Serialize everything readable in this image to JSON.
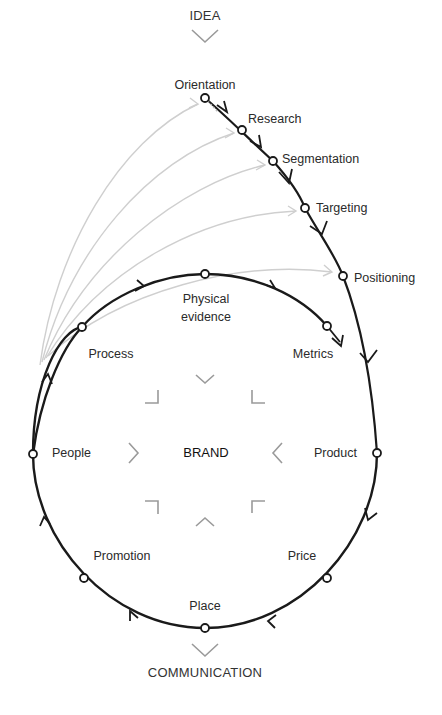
{
  "diagram": {
    "type": "brand-process-flow",
    "top_label": "IDEA",
    "bottom_label": "COMMUNICATION",
    "center_label": "BRAND",
    "colors": {
      "main_line": "#1a1a1a",
      "feedback_arcs": "#c8c8c8",
      "chevrons": "#9a9a9a",
      "node_fill": "#ffffff"
    },
    "strategy_path": [
      {
        "id": "orientation",
        "label": "Orientation"
      },
      {
        "id": "research",
        "label": "Research"
      },
      {
        "id": "segmentation",
        "label": "Segmentation"
      },
      {
        "id": "targeting",
        "label": "Targeting"
      },
      {
        "id": "positioning",
        "label": "Positioning"
      }
    ],
    "marketing_mix_loop": [
      {
        "id": "product",
        "label": "Product"
      },
      {
        "id": "price",
        "label": "Price"
      },
      {
        "id": "place",
        "label": "Place"
      },
      {
        "id": "promotion",
        "label": "Promotion"
      },
      {
        "id": "people",
        "label": "People"
      },
      {
        "id": "process",
        "label": "Process"
      },
      {
        "id": "physical_evidence",
        "label": "Physical evidence",
        "lines": [
          "Physical",
          "evidence"
        ]
      },
      {
        "id": "metrics",
        "label": "Metrics"
      }
    ],
    "center_chevrons": [
      "top",
      "top-right",
      "right",
      "bottom-right",
      "bottom",
      "bottom-left",
      "left",
      "top-left"
    ]
  }
}
